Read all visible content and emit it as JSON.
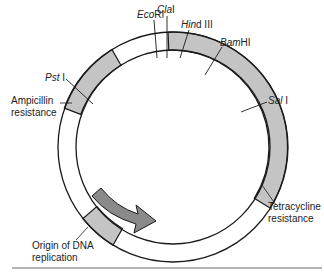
{
  "diagram": {
    "type": "plasmid-map",
    "colors": {
      "ring_stroke": "#1a1a1a",
      "gene_fill": "#c4c4c4",
      "arrow_fill": "#8a8a8a",
      "rule": "#9a9a9a",
      "text": "#222222"
    },
    "restriction_sites": [
      {
        "name_italic": "Eco",
        "name_rest": "RI"
      },
      {
        "name_italic": "Cla",
        "name_rest": "I"
      },
      {
        "name_italic": "Hin",
        "name_rest": "d III"
      },
      {
        "name_italic": "Bam",
        "name_rest": "HI"
      },
      {
        "name_italic": "Sal",
        "name_rest": " I"
      },
      {
        "name_italic": "Pst",
        "name_rest": " I"
      }
    ],
    "regions": {
      "ampicillin": {
        "line1": "Ampicillin",
        "line2": "resistance"
      },
      "tetracycline": {
        "line1": "Tetracycline",
        "line2": "resistance"
      },
      "origin": {
        "line1": "Origin of DNA",
        "line2": "replication"
      }
    }
  }
}
